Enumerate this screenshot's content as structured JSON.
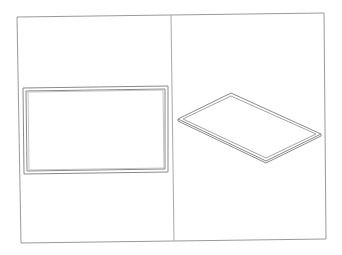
{
  "drawing": {
    "title": "",
    "background": "#ffffff",
    "line_color": "#8a8a8a",
    "frame_color": "#9a9a9a",
    "views": [
      {
        "name": "front-view",
        "shape": "rectangular-frame",
        "outer_rect": [
          23,
          87,
          168,
          173
        ],
        "inner_rect": [
          26,
          90,
          165,
          170
        ]
      },
      {
        "name": "isometric-view",
        "shape": "flat-rectangular-plate",
        "outer_corners": [
          [
            231,
            93
          ],
          [
            321,
            134
          ],
          [
            266,
            161
          ],
          [
            178,
            119
          ]
        ],
        "inner_corners": [
          [
            231,
            96
          ],
          [
            316,
            134
          ],
          [
            266,
            158
          ],
          [
            183,
            119
          ]
        ]
      }
    ],
    "sheet_border": [
      [
        17,
        17
      ],
      [
        324,
        13
      ],
      [
        326,
        239
      ],
      [
        21,
        243
      ]
    ],
    "divider": [
      [
        171,
        15
      ],
      [
        174,
        241
      ]
    ]
  }
}
